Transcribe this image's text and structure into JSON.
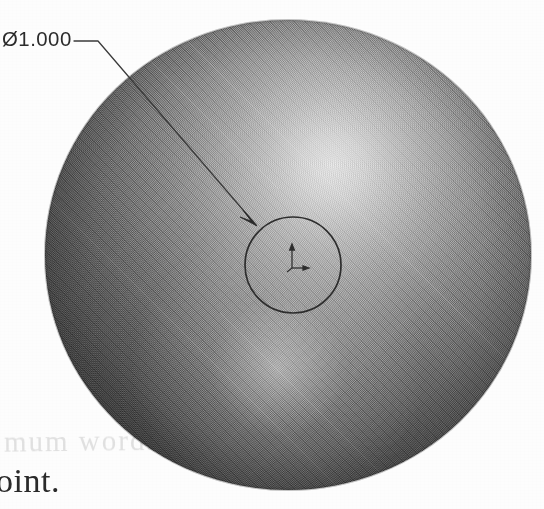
{
  "page": {
    "width": 544,
    "height": 509,
    "background_color": "#fdfdfd",
    "type": "scanned-cad-drawing"
  },
  "drawing": {
    "subject": "shaded-sphere",
    "sphere": {
      "name": "sphere-solid",
      "center_x": 288,
      "center_y": 255,
      "diameter_px": 470,
      "highlight_color": "#ececec",
      "shadow_color": "#272727",
      "highlight_position": "upper-center-right",
      "secondary_highlight_position": "lower-center-left"
    },
    "feature_circle": {
      "name": "center-hole-circle",
      "center_x": 293,
      "center_y": 265,
      "diameter_px": 96,
      "stroke_color": "#2a2a2a"
    },
    "origin_marker": {
      "name": "coordinate-origin-triad",
      "x": 293,
      "y": 258,
      "label": ""
    }
  },
  "dimension": {
    "label": "Ø1.000",
    "symbol": "Ø",
    "value": "1.000",
    "text_x": 2,
    "text_y": 27,
    "leader": {
      "shoulder_start_x": 74,
      "shoulder_start_y": 41,
      "shoulder_end_x": 98,
      "shoulder_end_y": 41,
      "arrow_tip_x": 256,
      "arrow_tip_y": 225,
      "stroke_color": "#3a3a3a"
    }
  },
  "annotations": {
    "body_text": "oint.",
    "ghost_text": "mum  words"
  }
}
